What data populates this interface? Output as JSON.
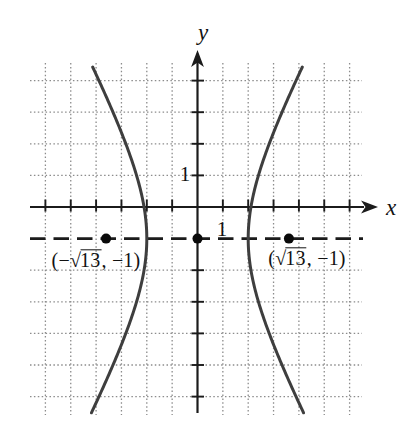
{
  "figure": {
    "background": "#ffffff",
    "axis_labels": {
      "x": "x",
      "y": "y"
    },
    "unit_labels": {
      "y_one": "1",
      "x_one": "1"
    },
    "point_labels": {
      "left": {
        "open": "(−",
        "sqrt": "√",
        "radicand": "13",
        "close": ", −1)"
      },
      "right": {
        "open": "(",
        "sqrt": "√",
        "radicand": "13",
        "close": ", −1)"
      }
    },
    "colors": {
      "axis": "#1b1b1b",
      "grid": "#8c8c8c",
      "curve": "#3e3e3e",
      "dashed_line": "#1b1b1b",
      "point": "#0a0a0a",
      "text": "#111111"
    }
  },
  "chart_data": {
    "type": "line",
    "curve": "hyperbola",
    "equation": "x^2/4 - (y+1)^2/9 = 1",
    "center": [
      0,
      -1
    ],
    "a": 2,
    "b": 3,
    "c": 3.6056,
    "vertices": [
      [
        -2,
        -1
      ],
      [
        2,
        -1
      ]
    ],
    "foci": [
      [
        -3.6056,
        -1
      ],
      [
        3.6056,
        -1
      ]
    ],
    "focal_axis_y": -1,
    "marked_points": [
      {
        "x": -3.6056,
        "y": -1,
        "label": "(−√13, −1)"
      },
      {
        "x": 0,
        "y": -1,
        "label": ""
      },
      {
        "x": 3.6056,
        "y": -1,
        "label": "(√13, −1)"
      }
    ],
    "grid": true,
    "grid_x_lines": [
      -6,
      -5,
      -4,
      -3,
      -2,
      -1,
      1,
      2,
      3,
      4,
      5,
      6
    ],
    "grid_y_lines": [
      4,
      3,
      2,
      1,
      -2,
      -3,
      -4,
      -5,
      -6
    ],
    "visible_tick_labels": {
      "x": [
        1
      ],
      "y": [
        1
      ]
    },
    "x_range": [
      -6.6,
      7.1
    ],
    "y_range": [
      -6.6,
      4.9
    ]
  }
}
